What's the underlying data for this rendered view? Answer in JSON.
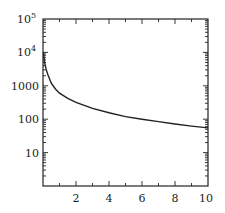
{
  "chart_data": {
    "type": "line",
    "title": "",
    "xlabel": "",
    "ylabel": "",
    "x_scale": "linear",
    "y_scale": "log",
    "xlim": [
      0,
      10
    ],
    "ylim": [
      1,
      100000
    ],
    "x_ticks": [
      2,
      4,
      6,
      8,
      10
    ],
    "x_tick_labels": [
      "2",
      "4",
      "6",
      "8",
      "10"
    ],
    "y_ticks": [
      10,
      100,
      1000,
      10000,
      100000
    ],
    "y_tick_labels": [
      "10",
      "100",
      "1000",
      "10^4",
      "10^5"
    ],
    "grid": false,
    "legend": null,
    "series": [
      {
        "name": "curve",
        "color": "#222222",
        "x": [
          0.03,
          0.1,
          0.2,
          0.3,
          0.5,
          0.75,
          1,
          1.5,
          2,
          3,
          4,
          5,
          6,
          7,
          8,
          9,
          10
        ],
        "y": [
          10000,
          5000,
          3000,
          2100,
          1200,
          800,
          600,
          420,
          320,
          210,
          155,
          120,
          100,
          85,
          72,
          62,
          55
        ]
      }
    ]
  },
  "axes": {
    "y_labels": {
      "e5": {
        "base": "10",
        "exp": "5"
      },
      "e4": {
        "base": "10",
        "exp": "4"
      },
      "e3": "1000",
      "e2": "100",
      "e1": "10"
    },
    "x_labels": [
      "2",
      "4",
      "6",
      "8",
      "10"
    ]
  }
}
